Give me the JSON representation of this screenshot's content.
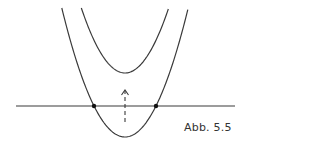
{
  "figure": {
    "caption": "Abb. 5.5",
    "line_color": "#3a3a3a",
    "elements": {
      "horizontal_line": {
        "x1": 16,
        "x2": 235,
        "y": 106
      },
      "lower_parabola": {
        "vertex": [
          125,
          137
        ],
        "a": 0.0323
      },
      "upper_parabola": {
        "vertex": [
          125,
          73
        ],
        "a": 0.0341
      },
      "intersection_points": [
        [
          94,
          106
        ],
        [
          156,
          106
        ]
      ],
      "shift_arrow": {
        "x": 125,
        "y_start": 122,
        "y_end": 90,
        "style": "dashed"
      }
    }
  }
}
